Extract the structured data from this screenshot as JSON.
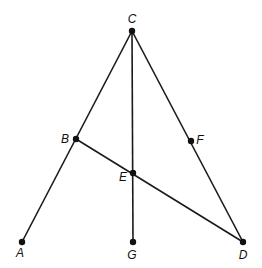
{
  "diagram": {
    "points": {
      "A": {
        "label": "A",
        "x": 22,
        "y": 242,
        "lx": 20,
        "ly": 257,
        "anchor": "middle"
      },
      "B": {
        "label": "B",
        "x": 76,
        "y": 139,
        "lx": 65,
        "ly": 143,
        "anchor": "middle"
      },
      "C": {
        "label": "C",
        "x": 132,
        "y": 31,
        "lx": 132,
        "ly": 23,
        "anchor": "middle"
      },
      "D": {
        "label": "D",
        "x": 243,
        "y": 242,
        "lx": 243,
        "ly": 259,
        "anchor": "middle"
      },
      "E": {
        "label": "E",
        "x": 133,
        "y": 173,
        "lx": 123,
        "ly": 181,
        "anchor": "middle"
      },
      "F": {
        "label": "F",
        "x": 191,
        "y": 141,
        "lx": 200,
        "ly": 144,
        "anchor": "middle"
      },
      "G": {
        "label": "G",
        "x": 133,
        "y": 242,
        "lx": 132,
        "ly": 259,
        "anchor": "middle"
      }
    },
    "segments": [
      [
        "C",
        "A"
      ],
      [
        "C",
        "D"
      ],
      [
        "C",
        "G"
      ],
      [
        "B",
        "D"
      ]
    ]
  }
}
